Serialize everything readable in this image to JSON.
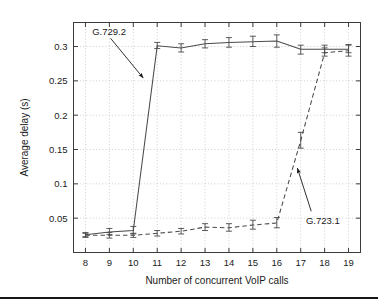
{
  "figure": {
    "background": "#ffffff",
    "frame_color": "#3c3c3c",
    "grid_color": "#b9b9b9",
    "series_color": "#4a4a4a",
    "bottom_rule_color": "#161616"
  },
  "chart_data": {
    "type": "line",
    "title": "",
    "xlabel": "Number of concurrent VoIP calls",
    "ylabel": "Average delay (s)",
    "xlim": [
      7.5,
      19.5
    ],
    "ylim": [
      0.0,
      0.335
    ],
    "xticks": [
      8,
      9,
      10,
      11,
      12,
      13,
      14,
      15,
      16,
      17,
      18,
      19
    ],
    "xtick_labels": [
      "8",
      "9",
      "10",
      "11",
      "12",
      "13",
      "14",
      "15",
      "16",
      "17",
      "18",
      "19"
    ],
    "yticks": [
      0.05,
      0.1,
      0.15,
      0.2,
      0.25,
      0.3
    ],
    "ytick_labels": [
      "0.05",
      "0.1",
      "0.15",
      "0.2",
      "0.25",
      "0.3"
    ],
    "grid": true,
    "legend_position": "annotations",
    "x": [
      8,
      9,
      10,
      11,
      12,
      13,
      14,
      15,
      16,
      17,
      18,
      19
    ],
    "series": [
      {
        "name": "G.729.2",
        "style": "solid",
        "marker": "errorbar",
        "values": [
          0.026,
          0.03,
          0.032,
          0.301,
          0.298,
          0.304,
          0.306,
          0.307,
          0.308,
          0.296,
          0.296,
          0.296
        ],
        "err_low": [
          0.023,
          0.026,
          0.027,
          0.297,
          0.292,
          0.298,
          0.299,
          0.3,
          0.299,
          0.289,
          0.291,
          0.291
        ],
        "err_high": [
          0.029,
          0.035,
          0.038,
          0.306,
          0.304,
          0.31,
          0.313,
          0.315,
          0.317,
          0.302,
          0.302,
          0.302
        ]
      },
      {
        "name": "G.723.1",
        "style": "dashed",
        "marker": "errorbar",
        "values": [
          0.025,
          0.025,
          0.025,
          0.028,
          0.031,
          0.037,
          0.036,
          0.04,
          0.043,
          0.163,
          0.291,
          0.294
        ],
        "err_low": [
          0.022,
          0.021,
          0.022,
          0.024,
          0.027,
          0.032,
          0.031,
          0.034,
          0.036,
          0.152,
          0.286,
          0.286
        ],
        "err_high": [
          0.028,
          0.029,
          0.028,
          0.032,
          0.035,
          0.042,
          0.042,
          0.047,
          0.051,
          0.175,
          0.298,
          0.303
        ]
      }
    ],
    "annotations": [
      {
        "text": "G.729.2",
        "label_x": 8.28,
        "label_y": 0.322,
        "arrow_from_x": 9.05,
        "arrow_from_y": 0.312,
        "arrow_to_x": 10.42,
        "arrow_to_y": 0.254
      },
      {
        "text": "G.723.1",
        "label_x": 17.22,
        "label_y": 0.046,
        "arrow_from_x": 17.44,
        "arrow_from_y": 0.06,
        "arrow_to_x": 16.86,
        "arrow_to_y": 0.123
      }
    ]
  }
}
